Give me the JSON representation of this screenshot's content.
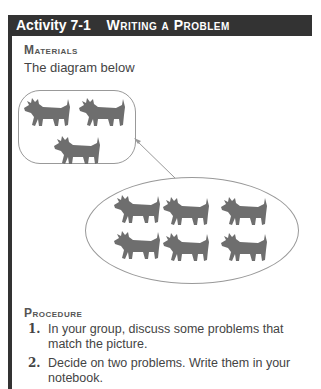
{
  "header": {
    "number": "Activity 7-1",
    "title": "Writing a Problem"
  },
  "materials": {
    "heading": "Materials",
    "text": "The diagram below"
  },
  "diagram": {
    "small_group_count": 3,
    "large_group_count": 6,
    "icon": "dog-icon",
    "colors": {
      "dog": "#6e6e6e",
      "outline": "#999999"
    }
  },
  "procedure": {
    "heading": "Procedure",
    "steps": [
      {
        "num": "1.",
        "text": "In your group, discuss some problems that match the picture."
      },
      {
        "num": "2.",
        "text": "Decide on two problems. Write them in your notebook."
      }
    ]
  }
}
